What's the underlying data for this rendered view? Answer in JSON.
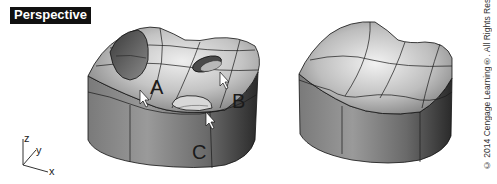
{
  "viewport": {
    "title": "Perspective",
    "label_background": "#111111",
    "label_color": "#ffffff"
  },
  "axes": {
    "z": "z",
    "y": "y",
    "x": "x"
  },
  "models": [
    {
      "name": "surface-with-holes",
      "callouts": [
        {
          "label": "A"
        },
        {
          "label": "B"
        },
        {
          "label": "C"
        }
      ]
    },
    {
      "name": "surface-repaired"
    }
  ],
  "copyright": "© 2014 Cengage Learning®. All Rights Reserved."
}
